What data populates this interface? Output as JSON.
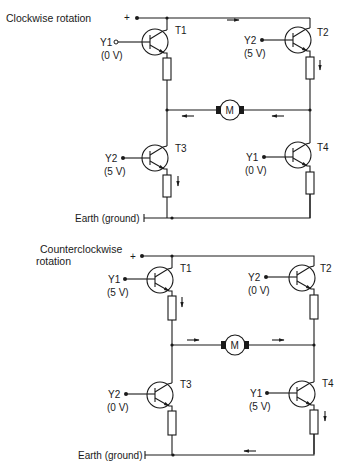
{
  "diagrams": [
    {
      "title": "Clockwise rotation",
      "title_lines": [
        "Clockwise rotation"
      ],
      "supply": "+",
      "motor": "M",
      "transistors": [
        {
          "id": "T1",
          "input": "Y1",
          "voltage": "(0 V)",
          "state": "off"
        },
        {
          "id": "T2",
          "input": "Y2",
          "voltage": "(5 V)",
          "state": "on"
        },
        {
          "id": "T3",
          "input": "Y2",
          "voltage": "(5 V)",
          "state": "on"
        },
        {
          "id": "T4",
          "input": "Y1",
          "voltage": "(0 V)",
          "state": "off"
        }
      ],
      "ground": "Earth (ground)",
      "current_path": "T2 → motor (right to left) → T3 → earth"
    },
    {
      "title": "Counterclockwise rotation",
      "title_lines": [
        "Counterclockwise",
        "rotation"
      ],
      "supply": "+",
      "motor": "M",
      "transistors": [
        {
          "id": "T1",
          "input": "Y1",
          "voltage": "(5 V)",
          "state": "on"
        },
        {
          "id": "T2",
          "input": "Y2",
          "voltage": "(0 V)",
          "state": "off"
        },
        {
          "id": "T3",
          "input": "Y2",
          "voltage": "(0 V)",
          "state": "off"
        },
        {
          "id": "T4",
          "input": "Y1",
          "voltage": "(5 V)",
          "state": "on"
        }
      ],
      "ground": "Earth (ground)",
      "current_path": "T1 → motor (left to right) → T4 → earth"
    }
  ]
}
